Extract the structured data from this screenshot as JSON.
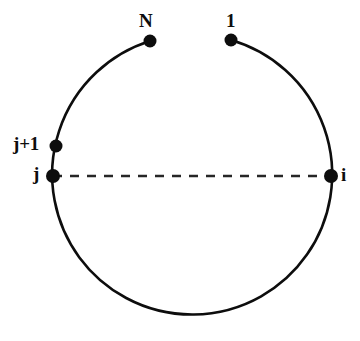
{
  "figure": {
    "type": "ring-topology-diagram",
    "background_color": "#ffffff",
    "stroke_color": "#0d0d0d",
    "dot_color": "#0d0d0d",
    "dashed_line_color": "#262626"
  },
  "circle": {
    "center_x": 191,
    "center_y": 180,
    "radius": 140,
    "stroke_width": 2.6,
    "gap_top": true,
    "gap_start_angle_deg": -70,
    "gap_end_angle_deg": -110
  },
  "nodes": [
    {
      "id": "N",
      "label": "N",
      "cx": 150,
      "cy": 41,
      "r": 6.5,
      "label_pos": "above-left"
    },
    {
      "id": "1",
      "label": "1",
      "cx": 231,
      "cy": 40,
      "r": 6.5,
      "label_pos": "above-left"
    },
    {
      "id": "jp1",
      "label": "j+1",
      "cx": 56,
      "cy": 146,
      "r": 6.5,
      "label_pos": "left"
    },
    {
      "id": "j",
      "label": "j",
      "cx": 53,
      "cy": 176,
      "r": 7.0,
      "label_pos": "left"
    },
    {
      "id": "i",
      "label": "i",
      "cx": 331,
      "cy": 176,
      "r": 7.0,
      "label_pos": "right"
    }
  ],
  "dashed_chord": {
    "from_node": "j",
    "to_node": "i",
    "x1": 53,
    "y1": 176,
    "x2": 331,
    "y2": 176,
    "dash_length": 9,
    "gap_length": 8,
    "stroke_width": 2.4
  },
  "labels": {
    "N": "N",
    "one": "1",
    "j_plus_1": "j+1",
    "j": "j",
    "i": "i"
  }
}
